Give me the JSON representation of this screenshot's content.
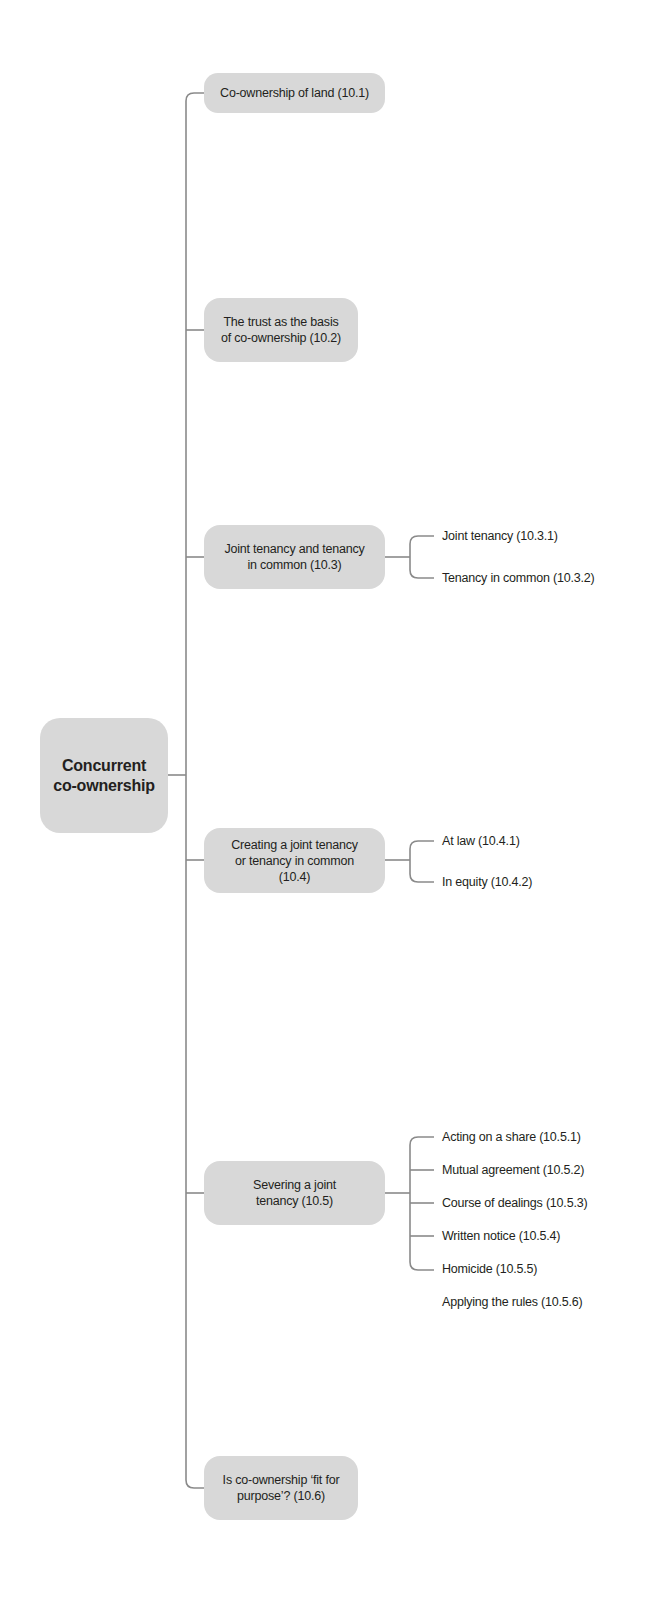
{
  "diagram": {
    "type": "mind-map",
    "colors": {
      "box_fill": "#d8d8d8",
      "line": "#8a8a8a",
      "text": "#231f20"
    },
    "root": {
      "label": "Concurrent\nco-ownership",
      "line1": "Concurrent",
      "line2": "co-ownership"
    },
    "branches": [
      {
        "label": "Co-ownership of land (10.1)",
        "children": []
      },
      {
        "label": "The trust as the basis of co-ownership (10.2)",
        "children": []
      },
      {
        "label": "Joint tenancy and tenancy in common (10.3)",
        "children": [
          "Joint tenancy (10.3.1)",
          "Tenancy in common (10.3.2)"
        ]
      },
      {
        "label": "Creating a joint tenancy or tenancy in common (10.4)",
        "children": [
          "At law (10.4.1)",
          "In equity (10.4.2)"
        ]
      },
      {
        "label": "Severing a joint tenancy (10.5)",
        "children": [
          "Acting on a share (10.5.1)",
          "Mutual agreement (10.5.2)",
          "Course of dealings (10.5.3)",
          "Written notice (10.5.4)",
          "Homicide (10.5.5)",
          "Applying the rules (10.5.6)"
        ]
      },
      {
        "label": "Is co-ownership ‘fit for purpose’? (10.6)",
        "children": []
      }
    ]
  }
}
